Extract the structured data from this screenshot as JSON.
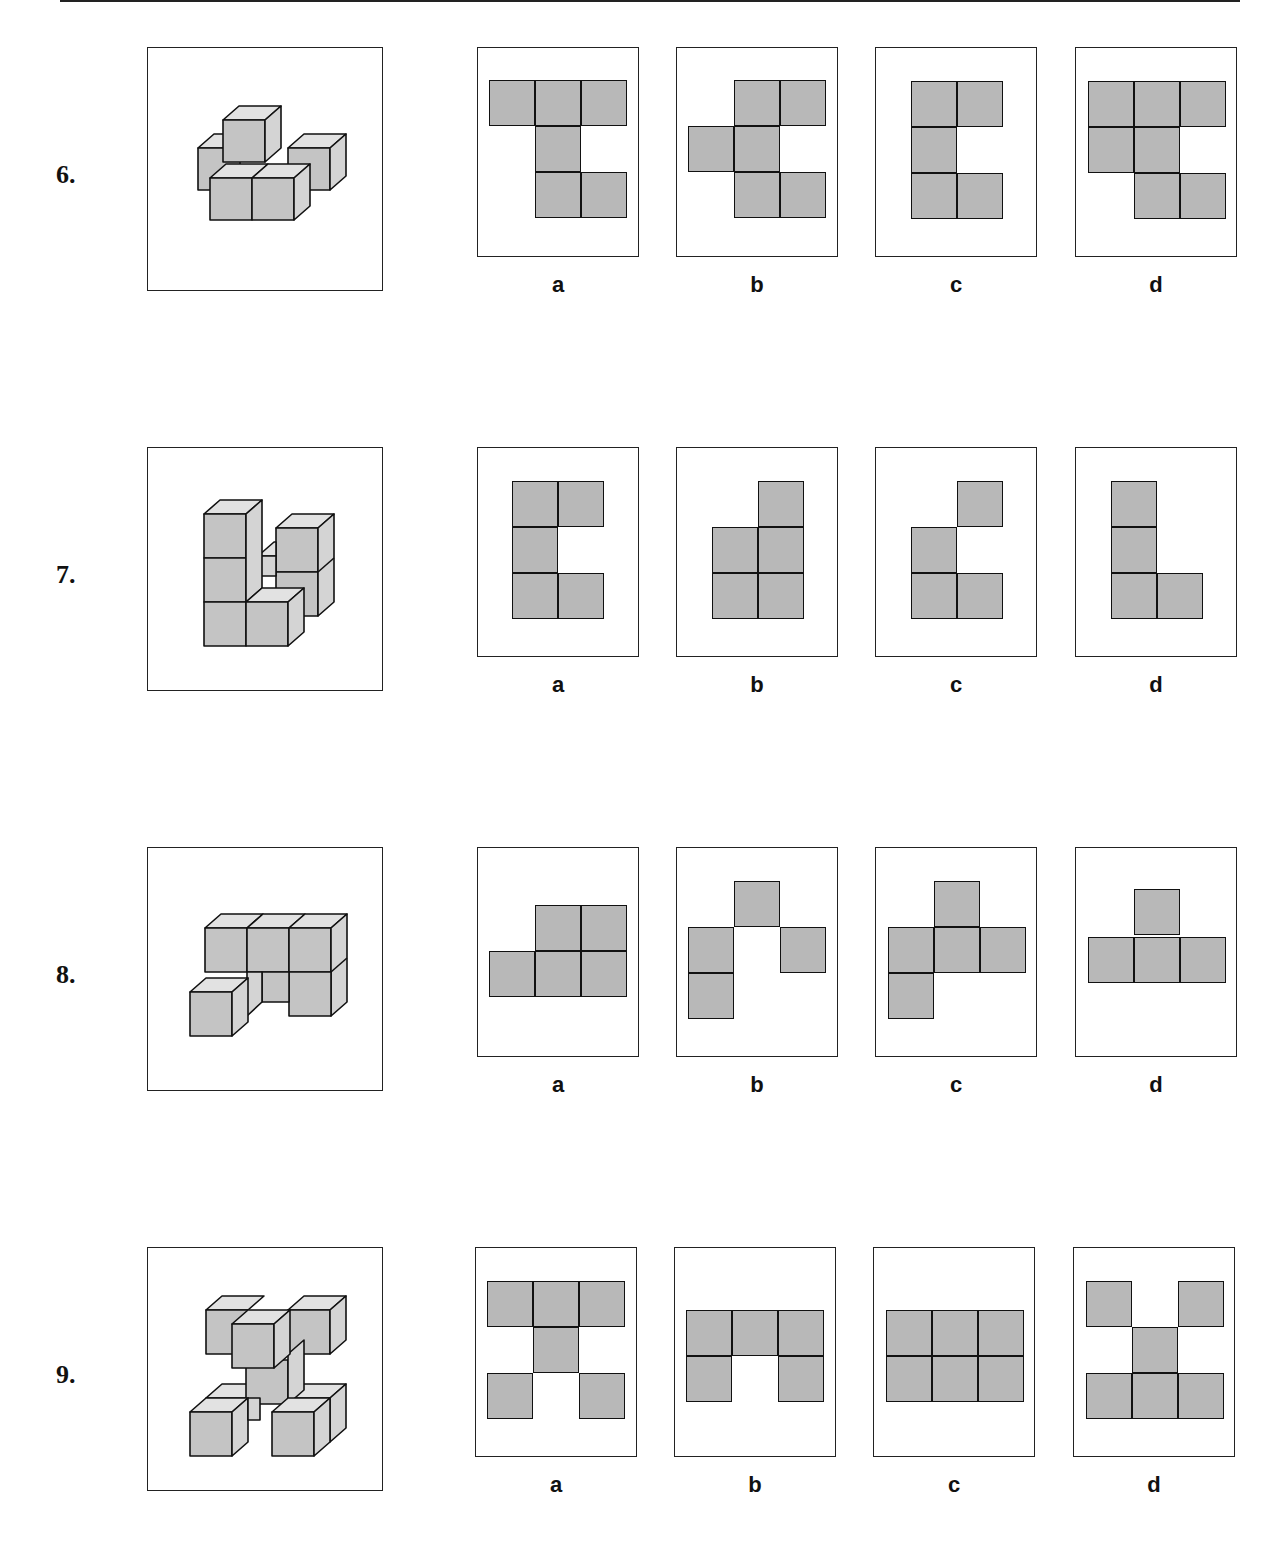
{
  "colors": {
    "cube_front": "#c4c4c4",
    "cube_top": "#e2e2e2",
    "cube_side": "#d4d4d4",
    "cell_fill": "#b8b8b8",
    "stroke": "#111111"
  },
  "questions": [
    {
      "number": "6.",
      "figure": "isometric-cubes-cross-shape",
      "options": [
        {
          "label": "a",
          "cells": [
            [
              0,
              0
            ],
            [
              1,
              0
            ],
            [
              2,
              0
            ],
            [
              1,
              1
            ],
            [
              1,
              2
            ],
            [
              2,
              2
            ]
          ]
        },
        {
          "label": "b",
          "cells": [
            [
              1,
              0
            ],
            [
              2,
              0
            ],
            [
              0,
              1
            ],
            [
              1,
              1
            ],
            [
              1,
              2
            ],
            [
              2,
              2
            ]
          ]
        },
        {
          "label": "c",
          "cells": [
            [
              0,
              0
            ],
            [
              1,
              0
            ],
            [
              0,
              1
            ],
            [
              0,
              2
            ],
            [
              1,
              2
            ]
          ]
        },
        {
          "label": "d",
          "cells": [
            [
              0,
              0
            ],
            [
              1,
              0
            ],
            [
              2,
              0
            ],
            [
              0,
              1
            ],
            [
              1,
              1
            ],
            [
              1,
              2
            ],
            [
              2,
              2
            ]
          ]
        }
      ]
    },
    {
      "number": "7.",
      "figure": "isometric-cubes-two-towers",
      "options": [
        {
          "label": "a",
          "cells": [
            [
              0,
              0
            ],
            [
              1,
              0
            ],
            [
              0,
              1
            ],
            [
              0,
              2
            ],
            [
              1,
              2
            ]
          ]
        },
        {
          "label": "b",
          "cells": [
            [
              1,
              0
            ],
            [
              0,
              1
            ],
            [
              1,
              1
            ],
            [
              0,
              2
            ],
            [
              1,
              2
            ]
          ]
        },
        {
          "label": "c",
          "cells": [
            [
              1,
              0
            ],
            [
              0,
              1
            ],
            [
              0,
              2
            ],
            [
              1,
              2
            ]
          ]
        },
        {
          "label": "d",
          "cells": [
            [
              0,
              0
            ],
            [
              0,
              1
            ],
            [
              0,
              2
            ],
            [
              1,
              2
            ]
          ]
        }
      ]
    },
    {
      "number": "8.",
      "figure": "isometric-cubes-wall-with-step",
      "options": [
        {
          "label": "a",
          "cells": [
            [
              1,
              0
            ],
            [
              2,
              0
            ],
            [
              0,
              1
            ],
            [
              1,
              1
            ],
            [
              2,
              1
            ]
          ]
        },
        {
          "label": "b",
          "cells": [
            [
              1,
              0
            ],
            [
              0,
              1
            ],
            [
              2,
              1
            ],
            [
              0,
              2
            ]
          ]
        },
        {
          "label": "c",
          "cells": [
            [
              1,
              0
            ],
            [
              0,
              1
            ],
            [
              1,
              1
            ],
            [
              2,
              1
            ],
            [
              0,
              2
            ]
          ]
        },
        {
          "label": "d",
          "cells": [
            [
              1,
              0
            ],
            [
              0,
              1
            ],
            [
              1,
              1
            ],
            [
              2,
              1
            ]
          ]
        }
      ]
    },
    {
      "number": "9.",
      "figure": "isometric-cubes-x-shape",
      "options": [
        {
          "label": "a",
          "cells": [
            [
              0,
              0
            ],
            [
              1,
              0
            ],
            [
              2,
              0
            ],
            [
              1,
              1
            ],
            [
              0,
              2
            ],
            [
              2,
              2
            ]
          ]
        },
        {
          "label": "b",
          "cells": [
            [
              0,
              0
            ],
            [
              1,
              0
            ],
            [
              2,
              0
            ],
            [
              0,
              1
            ],
            [
              2,
              1
            ]
          ]
        },
        {
          "label": "c",
          "cells": [
            [
              0,
              0
            ],
            [
              1,
              0
            ],
            [
              2,
              0
            ],
            [
              0,
              1
            ],
            [
              1,
              1
            ],
            [
              2,
              1
            ]
          ]
        },
        {
          "label": "d",
          "cells": [
            [
              0,
              0
            ],
            [
              2,
              0
            ],
            [
              1,
              1
            ],
            [
              0,
              2
            ],
            [
              1,
              2
            ],
            [
              2,
              2
            ]
          ]
        }
      ]
    }
  ]
}
